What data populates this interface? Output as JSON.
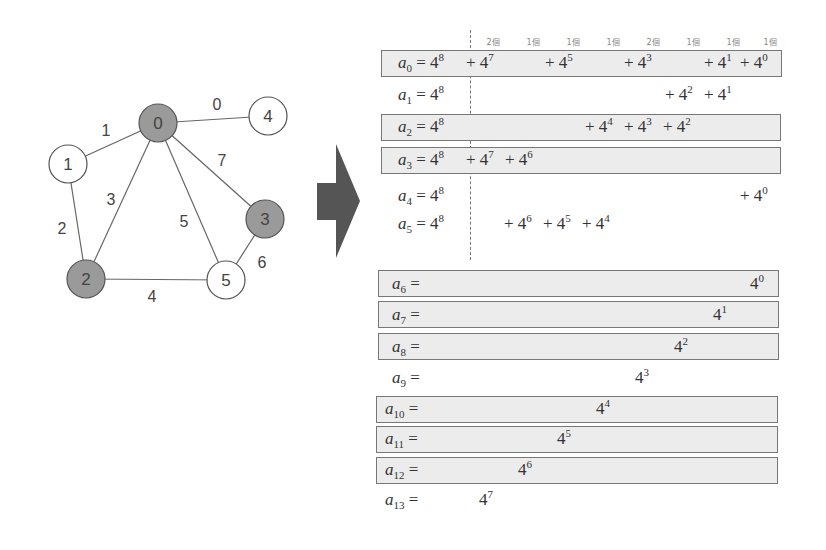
{
  "graph": {
    "nodes": [
      {
        "id": "0",
        "x": 158,
        "y": 123,
        "shaded": true
      },
      {
        "id": "1",
        "x": 68,
        "y": 164,
        "shaded": false
      },
      {
        "id": "2",
        "x": 86,
        "y": 279,
        "shaded": true
      },
      {
        "id": "3",
        "x": 265,
        "y": 219,
        "shaded": true
      },
      {
        "id": "4",
        "x": 268,
        "y": 116,
        "shaded": false
      },
      {
        "id": "5",
        "x": 226,
        "y": 280,
        "shaded": false
      }
    ],
    "edges": [
      {
        "from": "0",
        "to": "4",
        "label": "0",
        "lx": 217,
        "ly": 110
      },
      {
        "from": "0",
        "to": "1",
        "label": "1",
        "lx": 106,
        "ly": 136
      },
      {
        "from": "1",
        "to": "2",
        "label": "2",
        "lx": 62,
        "ly": 234
      },
      {
        "from": "0",
        "to": "2",
        "label": "3",
        "lx": 111,
        "ly": 205
      },
      {
        "from": "2",
        "to": "5",
        "label": "4",
        "lx": 152,
        "ly": 302
      },
      {
        "from": "0",
        "to": "5",
        "label": "5",
        "lx": 184,
        "ly": 227
      },
      {
        "from": "3",
        "to": "5",
        "label": "6",
        "lx": 262,
        "ly": 268
      },
      {
        "from": "0",
        "to": "3",
        "label": "7",
        "lx": 222,
        "ly": 166
      }
    ],
    "colors": {
      "shaded_fill": "#9a9a9a",
      "node_stroke": "#555555",
      "edge": "#666666",
      "arrow": "#555555"
    }
  },
  "column_headers": [
    {
      "x": 493,
      "text": "2個"
    },
    {
      "x": 533,
      "text": "1個"
    },
    {
      "x": 573,
      "text": "1個"
    },
    {
      "x": 613,
      "text": "1個"
    },
    {
      "x": 653,
      "text": "2個"
    },
    {
      "x": 693,
      "text": "1個"
    },
    {
      "x": 733,
      "text": "1個"
    },
    {
      "x": 770,
      "text": "1個"
    }
  ],
  "rows": [
    {
      "sub": "0",
      "eq": "= 4",
      "eq_exp": "8",
      "lx": 398,
      "y": 53,
      "boxed": true,
      "terms": [
        {
          "x": 466,
          "text": "+ 4",
          "exp": "7"
        },
        {
          "x": 545,
          "text": "+ 4",
          "exp": "5"
        },
        {
          "x": 624,
          "text": "+ 4",
          "exp": "3"
        },
        {
          "x": 704,
          "text": "+ 4",
          "exp": "1"
        },
        {
          "x": 740,
          "text": "+ 4",
          "exp": "0"
        }
      ]
    },
    {
      "sub": "1",
      "eq": "= 4",
      "eq_exp": "8",
      "lx": 398,
      "y": 85,
      "boxed": false,
      "terms": [
        {
          "x": 665,
          "text": "+ 4",
          "exp": "2"
        },
        {
          "x": 704,
          "text": "+ 4",
          "exp": "1"
        }
      ]
    },
    {
      "sub": "2",
      "eq": "= 4",
      "eq_exp": "8",
      "lx": 398,
      "y": 117,
      "boxed": true,
      "terms": [
        {
          "x": 585,
          "text": "+ 4",
          "exp": "4"
        },
        {
          "x": 624,
          "text": "+ 4",
          "exp": "3"
        },
        {
          "x": 663,
          "text": "+ 4",
          "exp": "2"
        }
      ]
    },
    {
      "sub": "3",
      "eq": "= 4",
      "eq_exp": "8",
      "lx": 398,
      "y": 150,
      "boxed": true,
      "terms": [
        {
          "x": 466,
          "text": "+ 4",
          "exp": "7"
        },
        {
          "x": 505,
          "text": "+ 4",
          "exp": "6"
        }
      ]
    },
    {
      "sub": "4",
      "eq": "= 4",
      "eq_exp": "8",
      "lx": 398,
      "y": 186,
      "boxed": false,
      "terms": [
        {
          "x": 740,
          "text": "+ 4",
          "exp": "0"
        }
      ]
    },
    {
      "sub": "5",
      "eq": "= 4",
      "eq_exp": "8",
      "lx": 398,
      "y": 214,
      "boxed": false,
      "terms": [
        {
          "x": 504,
          "text": "+ 4",
          "exp": "6"
        },
        {
          "x": 543,
          "text": "+ 4",
          "exp": "5"
        },
        {
          "x": 582,
          "text": "+ 4",
          "exp": "4"
        }
      ]
    },
    {
      "sub": "6",
      "eq": "=",
      "eq_exp": "",
      "lx": 392,
      "y": 274,
      "boxed": true,
      "terms": [
        {
          "x": 750,
          "text": "4",
          "exp": "0"
        }
      ]
    },
    {
      "sub": "7",
      "eq": "=",
      "eq_exp": "",
      "lx": 392,
      "y": 305,
      "boxed": true,
      "terms": [
        {
          "x": 713,
          "text": "4",
          "exp": "1"
        }
      ]
    },
    {
      "sub": "8",
      "eq": "=",
      "eq_exp": "",
      "lx": 392,
      "y": 337,
      "boxed": true,
      "terms": [
        {
          "x": 674,
          "text": "4",
          "exp": "2"
        }
      ]
    },
    {
      "sub": "9",
      "eq": "=",
      "eq_exp": "",
      "lx": 392,
      "y": 368,
      "boxed": false,
      "terms": [
        {
          "x": 635,
          "text": "4",
          "exp": "3"
        }
      ]
    },
    {
      "sub": "10",
      "eq": "=",
      "eq_exp": "",
      "lx": 385,
      "y": 399,
      "boxed": true,
      "terms": [
        {
          "x": 596,
          "text": "4",
          "exp": "4"
        }
      ]
    },
    {
      "sub": "11",
      "eq": "=",
      "eq_exp": "",
      "lx": 385,
      "y": 429,
      "boxed": true,
      "terms": [
        {
          "x": 557,
          "text": "4",
          "exp": "5"
        }
      ]
    },
    {
      "sub": "12",
      "eq": "=",
      "eq_exp": "",
      "lx": 385,
      "y": 460,
      "boxed": true,
      "terms": [
        {
          "x": 518,
          "text": "4",
          "exp": "6"
        }
      ]
    },
    {
      "sub": "13",
      "eq": "=",
      "eq_exp": "",
      "lx": 385,
      "y": 490,
      "boxed": false,
      "terms": [
        {
          "x": 479,
          "text": "4",
          "exp": "7"
        }
      ]
    }
  ],
  "boxes": [
    {
      "row": "0",
      "x": 381,
      "y": 50,
      "w": 401,
      "h": 27
    },
    {
      "row": "2",
      "x": 381,
      "y": 114,
      "w": 400,
      "h": 27
    },
    {
      "row": "3",
      "x": 381,
      "y": 147,
      "w": 400,
      "h": 27
    },
    {
      "row": "6",
      "x": 378,
      "y": 270,
      "w": 401,
      "h": 27
    },
    {
      "row": "7",
      "x": 378,
      "y": 301,
      "w": 401,
      "h": 27
    },
    {
      "row": "8",
      "x": 378,
      "y": 333,
      "w": 401,
      "h": 27
    },
    {
      "row": "10",
      "x": 376,
      "y": 396,
      "w": 402,
      "h": 27
    },
    {
      "row": "11",
      "x": 376,
      "y": 426,
      "w": 402,
      "h": 27
    },
    {
      "row": "12",
      "x": 376,
      "y": 457,
      "w": 402,
      "h": 27
    }
  ]
}
